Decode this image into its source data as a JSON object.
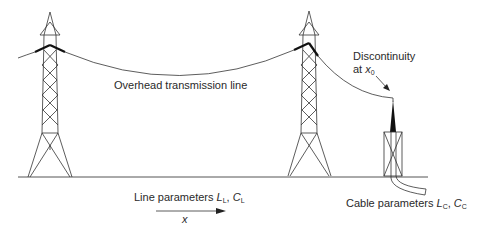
{
  "labels": {
    "overhead_line": "Overhead transmission line",
    "discontinuity_line1": "Discontinuity",
    "discontinuity_line2_prefix": "at ",
    "discontinuity_var": "x",
    "discontinuity_sub": "0",
    "line_params_prefix": "Line parameters ",
    "line_L": "L",
    "line_L_sub": "L",
    "line_sep": ", ",
    "line_C": "C",
    "line_C_sub": "L",
    "direction_var": "x",
    "cable_params_prefix": "Cable parameters ",
    "cable_L": "L",
    "cable_L_sub": "C",
    "cable_sep": ", ",
    "cable_C": "C",
    "cable_C_sub": "C"
  },
  "colors": {
    "line": "#333333",
    "ground": "#555555",
    "insulator": "#111111",
    "background": "#ffffff"
  }
}
